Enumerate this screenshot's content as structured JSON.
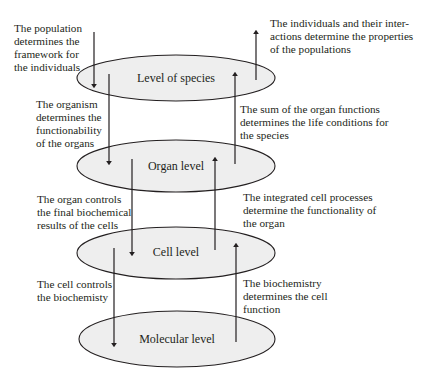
{
  "levels": [
    {
      "label": "Level of species",
      "cx": 176,
      "cy": 78,
      "rx": 99,
      "ry": 23
    },
    {
      "label": "Organ level",
      "cx": 176,
      "cy": 166,
      "rx": 99,
      "ry": 26
    },
    {
      "label": "Cell level",
      "cx": 176,
      "cy": 253,
      "rx": 99,
      "ry": 26
    },
    {
      "label": "Molecular level",
      "cx": 177,
      "cy": 339,
      "rx": 98,
      "ry": 28
    }
  ],
  "annotations": {
    "population": "The population\ndetermines the\nframework for\nthe individuals",
    "individuals": "The individuals and their inter-\nactions determine the properties\nof the populations",
    "organism": "The organism\ndetermines the\nfunctionability\nof the organs",
    "organ_sum": "The sum of the organ functions\ndetermines the life conditions for\nthe species",
    "organ_controls": "The organ controls\nthe final biochemical\nresults of the cells",
    "integrated": "The integrated cell processes\ndetermine the functionality of\nthe organ",
    "cell_controls": "The cell controls\nthe biochemisty",
    "biochemistry": "The biochemistry\ndetermines the cell\nfunction"
  },
  "arrows": [
    {
      "name": "population-down-arrow",
      "x": 94,
      "y1": 32,
      "y2": 86,
      "dir": "down"
    },
    {
      "name": "individuals-up-arrow",
      "x": 256,
      "y1": 80,
      "y2": 32,
      "dir": "up"
    },
    {
      "name": "organism-down-arrow",
      "x": 109,
      "y1": 74,
      "y2": 163,
      "dir": "down"
    },
    {
      "name": "organ-sum-up-arrow",
      "x": 235,
      "y1": 164,
      "y2": 74,
      "dir": "up"
    },
    {
      "name": "organ-controls-down-arrow",
      "x": 132,
      "y1": 159,
      "y2": 254,
      "dir": "down"
    },
    {
      "name": "integrated-up-arrow",
      "x": 215,
      "y1": 250,
      "y2": 159,
      "dir": "up"
    },
    {
      "name": "cell-controls-down-arrow",
      "x": 114,
      "y1": 248,
      "y2": 345,
      "dir": "down"
    },
    {
      "name": "biochemistry-up-arrow",
      "x": 236,
      "y1": 342,
      "y2": 245,
      "dir": "up"
    }
  ],
  "colors": {
    "ellipse_fill": "#eeeeee",
    "stroke": "#231f20",
    "text": "#231f20"
  }
}
